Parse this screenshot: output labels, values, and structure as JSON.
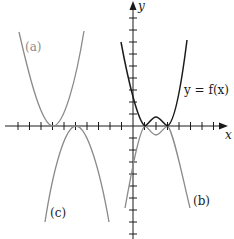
{
  "figure": {
    "axes": {
      "x_label": "x",
      "y_label": "y",
      "origin_px": [
        133,
        126
      ],
      "tick_spacing_px": 11.5
    },
    "curves": [
      {
        "id": "f",
        "label": "y = f(x)",
        "color": "#1a1a1a",
        "description": "W-shaped curve touching x-axis at x=1 and x=3 with local max at x=2"
      },
      {
        "id": "a",
        "label": "(a)",
        "color": "#8a8a8a",
        "description": "upward parabola-like shape with vertex on x-axis left of origin"
      },
      {
        "id": "b",
        "label": "(b)",
        "color": "#8a8a8a",
        "description": "reflection of f across x-axis, M-shaped"
      },
      {
        "id": "c",
        "label": "(c)",
        "color": "#8a8a8a",
        "description": "downward parabola-like shape with vertex on x-axis left of origin"
      }
    ]
  },
  "labels": {
    "x": "x",
    "y": "y",
    "f": "y = f(x)",
    "a": "(a)",
    "b": "(b)",
    "c": "(c)"
  }
}
